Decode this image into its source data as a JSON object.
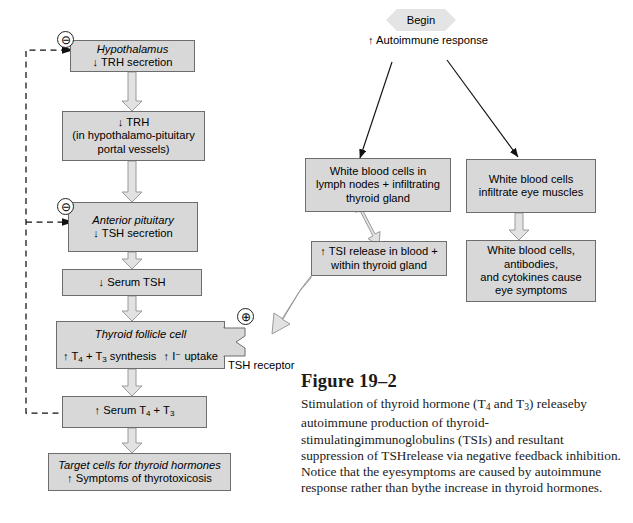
{
  "figure": {
    "title": "Figure 19–2",
    "caption_lines": [
      "Stimulation of thyroid hormone (T4 and T3) release",
      "by autoimmune production of thyroid-stimulating",
      "immunoglobulins (TSIs) and resultant suppression of TSH",
      "release via negative feedback inhibition. Notice that the eye",
      "symptoms are caused by autoimmune response rather than by",
      "the increase in thyroid hormones."
    ]
  },
  "start": {
    "label": "Begin"
  },
  "trigger": {
    "line1": "↑ Autoimmune",
    "line2": "response"
  },
  "left_chain": {
    "hypothalamus": {
      "line1": "Hypothalamus",
      "line2": "↓ TRH secretion"
    },
    "trh": {
      "line1": "↓ TRH",
      "line2": "(in hypothalamo-pituitary",
      "line3": "portal vessels)"
    },
    "anterior_pituitary": {
      "line1": "Anterior pituitary",
      "line2": "↓ TSH secretion"
    },
    "serum_tsh": {
      "line1": "↓ Serum TSH"
    },
    "follicle": {
      "line1": "Thyroid follicle cell",
      "line2": "↑ T4 + T3 synthesis",
      "line3": "↑ I⁻ uptake"
    },
    "serum_t4t3": {
      "line1": "↑ Serum T4 + T3"
    },
    "target_cells": {
      "line1": "Target cells for thyroid hormones",
      "line2": "↑ Symptoms of thyrotoxicosis"
    }
  },
  "right_chain": {
    "wbc_lymph": {
      "line1": "White blood cells in",
      "line2": "lymph nodes + infiltrating",
      "line3": "thyroid gland"
    },
    "tsi_release": {
      "line1": "↑ TSI release in blood +",
      "line2": "within thyroid gland"
    },
    "wbc_eye": {
      "line1": "White blood cells",
      "line2": "infiltrate eye muscles"
    },
    "eye_symptoms": {
      "line1": "White blood cells,",
      "line2": "antibodies,",
      "line3": "and cytokines cause",
      "line4": "eye symptoms"
    }
  },
  "receptor": {
    "line1": "TSH",
    "line2": "receptor"
  },
  "signs": {
    "negative_top": "⊖",
    "negative_mid": "⊖",
    "positive": "⊕"
  },
  "colors": {
    "box_fill": "#d8d8d8",
    "box_stroke": "#6d6d6d",
    "arrow_fill": "#e2e2e2",
    "arrow_stroke": "#9a9a9a",
    "thin_arrow": "#111111",
    "dashed_line": "#111111",
    "text": "#000000"
  }
}
